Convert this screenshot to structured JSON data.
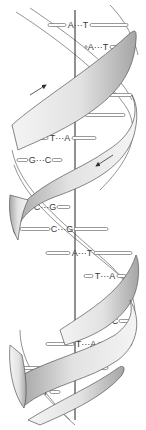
{
  "diagram": {
    "axis_x": 75,
    "colors": {
      "strand_outline": "#555555",
      "strand_light": "#f2f2f2",
      "strand_dark": "#a8a8a8",
      "axis": "#222222",
      "label": "#3a3a3a"
    },
    "arrows": [
      {
        "name": "strand-direction-up-arrow",
        "direction": "up-right",
        "x1": 30,
        "y1": 95,
        "x2": 46,
        "y2": 85
      },
      {
        "name": "strand-direction-down-arrow",
        "direction": "down-left",
        "x1": 113,
        "y1": 155,
        "x2": 96,
        "y2": 166
      }
    ],
    "base_pairs": [
      {
        "left": "A",
        "right": "T",
        "label": "A···T",
        "y": 25,
        "cx": 78,
        "x1": 48,
        "x2": 128
      },
      {
        "left": "A",
        "right": "T",
        "label": "A···T",
        "y": 47,
        "cx": 98,
        "x1": 85,
        "x2": 122
      },
      {
        "left": "C",
        "right": "G",
        "label": "C···G",
        "y": 95,
        "cx": 97,
        "x1": 84,
        "x2": 132
      },
      {
        "left": "A",
        "right": "T",
        "label": "A···T",
        "y": 115,
        "cx": 73,
        "x1": 45,
        "x2": 125
      },
      {
        "left": "T",
        "right": "A",
        "label": "T···A",
        "y": 138,
        "cx": 60,
        "x1": 18,
        "x2": 96
      },
      {
        "left": "G",
        "right": "C",
        "label": "G···C",
        "y": 160,
        "cx": 40,
        "x1": 17,
        "x2": 62
      },
      {
        "left": "C",
        "right": "G",
        "label": "C···G",
        "y": 207,
        "cx": 45,
        "x1": 22,
        "x2": 70
      },
      {
        "left": "C",
        "right": "G",
        "label": "C···G",
        "y": 229,
        "cx": 62,
        "x1": 20,
        "x2": 108
      },
      {
        "left": "A",
        "right": "T",
        "label": "A···T",
        "y": 253,
        "cx": 82,
        "x1": 46,
        "x2": 132
      },
      {
        "left": "T",
        "right": "A",
        "label": "T···A",
        "y": 276,
        "cx": 105,
        "x1": 84,
        "x2": 126
      },
      {
        "left": "G",
        "right": "C",
        "label": "G···C",
        "y": 321,
        "cx": 107,
        "x1": 88,
        "x2": 132
      },
      {
        "left": "T",
        "right": "A",
        "label": "T···A",
        "y": 344,
        "cx": 86,
        "x1": 46,
        "x2": 132
      },
      {
        "left": "C",
        "right": "G",
        "label": "C···G",
        "y": 368,
        "cx": 64,
        "x1": 20,
        "x2": 108
      },
      {
        "left": "A",
        "right": "T",
        "label": "A···T",
        "y": 392,
        "cx": 38,
        "x1": 18,
        "x2": 60
      }
    ]
  }
}
